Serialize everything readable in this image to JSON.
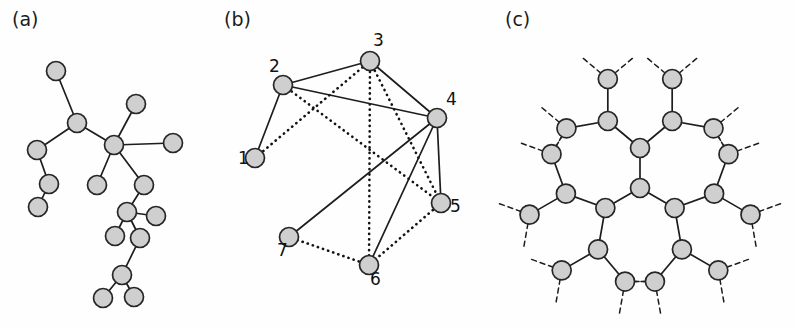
{
  "figure": {
    "background_color": "#fefefe",
    "node_fill_color": "#cfcfcf",
    "node_stroke_color": "#262626",
    "edge_color": "#1d1d1d"
  },
  "panels": [
    {
      "id": "a",
      "label": "(a)",
      "label_pos": [
        12,
        26
      ],
      "description": "irregular random tree graph",
      "node_radius": 9.5,
      "nodes": [
        {
          "id": "a1",
          "x": 56,
          "y": 71
        },
        {
          "id": "a2",
          "x": 77,
          "y": 123
        },
        {
          "id": "a3",
          "x": 37,
          "y": 150
        },
        {
          "id": "a4",
          "x": 49,
          "y": 184
        },
        {
          "id": "a5",
          "x": 38,
          "y": 207
        },
        {
          "id": "a6",
          "x": 114,
          "y": 145
        },
        {
          "id": "a7",
          "x": 136,
          "y": 104
        },
        {
          "id": "a8",
          "x": 173,
          "y": 143
        },
        {
          "id": "a9",
          "x": 97,
          "y": 185
        },
        {
          "id": "a10",
          "x": 144,
          "y": 185
        },
        {
          "id": "a11",
          "x": 127,
          "y": 212
        },
        {
          "id": "a12",
          "x": 156,
          "y": 216
        },
        {
          "id": "a13",
          "x": 115,
          "y": 236
        },
        {
          "id": "a14",
          "x": 140,
          "y": 238
        },
        {
          "id": "a15",
          "x": 122,
          "y": 275
        },
        {
          "id": "a16",
          "x": 103,
          "y": 298
        },
        {
          "id": "a17",
          "x": 134,
          "y": 297
        }
      ],
      "edges": [
        [
          "a1",
          "a2"
        ],
        [
          "a2",
          "a3"
        ],
        [
          "a3",
          "a4"
        ],
        [
          "a4",
          "a5"
        ],
        [
          "a2",
          "a6"
        ],
        [
          "a6",
          "a7"
        ],
        [
          "a6",
          "a8"
        ],
        [
          "a6",
          "a9"
        ],
        [
          "a6",
          "a10"
        ],
        [
          "a10",
          "a11"
        ],
        [
          "a11",
          "a12"
        ],
        [
          "a11",
          "a13"
        ],
        [
          "a11",
          "a14"
        ],
        [
          "a14",
          "a15"
        ],
        [
          "a15",
          "a16"
        ],
        [
          "a15",
          "a17"
        ]
      ],
      "edge_style": "solid"
    },
    {
      "id": "b",
      "label": "(b)",
      "label_pos": [
        224,
        26
      ],
      "description": "labeled graph with solid and dotted edges",
      "node_radius": 9.5,
      "nodes": [
        {
          "id": "1",
          "label": "1",
          "x": 255,
          "y": 158,
          "label_pos": [
            238,
            164
          ]
        },
        {
          "id": "2",
          "label": "2",
          "x": 283,
          "y": 85,
          "label_pos": [
            269,
            72
          ]
        },
        {
          "id": "3",
          "label": "3",
          "x": 370,
          "y": 61,
          "label_pos": [
            373,
            46
          ]
        },
        {
          "id": "4",
          "label": "4",
          "x": 437,
          "y": 118,
          "label_pos": [
            446,
            105
          ]
        },
        {
          "id": "5",
          "label": "5",
          "x": 441,
          "y": 203,
          "label_pos": [
            450,
            212
          ]
        },
        {
          "id": "6",
          "label": "6",
          "x": 369,
          "y": 265,
          "label_pos": [
            370,
            285
          ]
        },
        {
          "id": "7",
          "label": "7",
          "x": 289,
          "y": 237,
          "label_pos": [
            277,
            256
          ]
        }
      ],
      "solid_edges": [
        [
          "2",
          "1"
        ],
        [
          "2",
          "3"
        ],
        [
          "2",
          "4"
        ],
        [
          "3",
          "4"
        ],
        [
          "4",
          "5"
        ],
        [
          "4",
          "6"
        ],
        [
          "4",
          "7"
        ]
      ],
      "dotted_edges": [
        [
          "1",
          "3"
        ],
        [
          "2",
          "5"
        ],
        [
          "3",
          "5"
        ],
        [
          "3",
          "6"
        ],
        [
          "5",
          "6"
        ],
        [
          "6",
          "7"
        ]
      ]
    },
    {
      "id": "c",
      "label": "(c)",
      "label_pos": [
        505,
        26
      ],
      "description": "Cayley tree / Bethe lattice with coordination number 3, dashed stubs at periphery",
      "node_radius": 9.5,
      "center": [
        640,
        188
      ],
      "branch_angles_deg": [
        270,
        30,
        150
      ],
      "levels": 3,
      "level_lengths": [
        40,
        42,
        42
      ],
      "branch_spread_deg": 50,
      "stub_length": 32
    }
  ]
}
